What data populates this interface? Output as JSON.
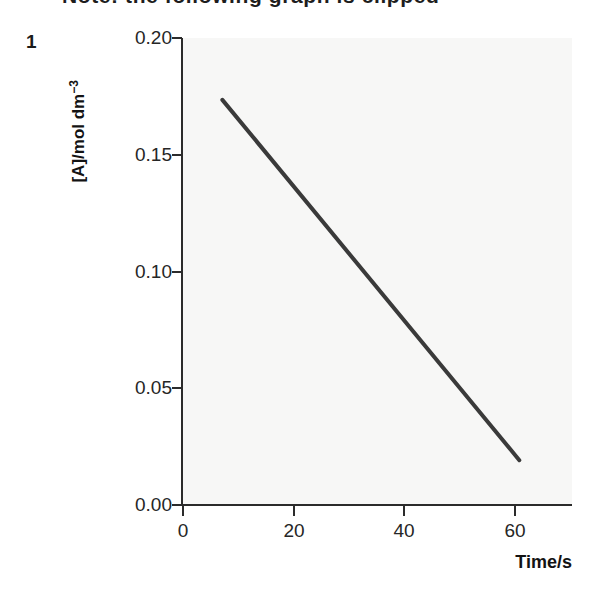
{
  "header": {
    "cropped_text": "Note: the following graph is clipped"
  },
  "figure": {
    "number": "1"
  },
  "axes": {
    "y_title": "[A]/mol dm",
    "y_title_exponent": "−3",
    "x_title": "Time/s",
    "y_ticks": [
      "0.00",
      "0.05",
      "0.10",
      "0.15",
      "0.20"
    ],
    "x_ticks": [
      "0",
      "20",
      "40",
      "60"
    ]
  },
  "chart_data": {
    "type": "line",
    "title": "",
    "xlabel": "Time/s",
    "ylabel": "[A]/mol dm−3",
    "xlim": [
      0,
      71
    ],
    "ylim": [
      0.0,
      0.2
    ],
    "xticks": [
      0,
      20,
      40,
      60
    ],
    "yticks": [
      0.0,
      0.05,
      0.1,
      0.15,
      0.2
    ],
    "grid": false,
    "legend": false,
    "series": [
      {
        "name": "[A]",
        "color": "#3a3a3a",
        "linewidth": 4,
        "x": [
          7.3,
          61.0
        ],
        "y": [
          0.1735,
          0.0192
        ]
      }
    ],
    "annotations": []
  },
  "colors": {
    "plot_background": "#f7f7f6",
    "axis": "#2b2b2b",
    "line": "#3a3a3a",
    "text": "#262626"
  }
}
